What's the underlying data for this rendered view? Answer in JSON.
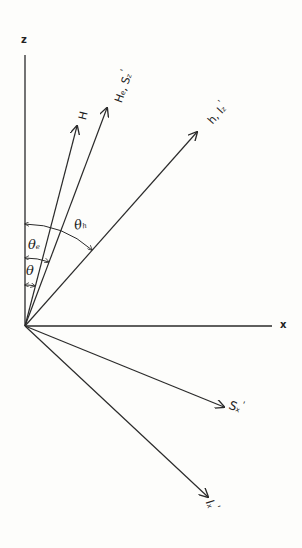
{
  "diagram": {
    "type": "vector-diagram",
    "origin": [
      25,
      326
    ],
    "axes": {
      "z": {
        "label": "z",
        "end": [
          25,
          55
        ]
      },
      "x": {
        "label": "x",
        "end": [
          272,
          326
        ]
      }
    },
    "vectors": [
      {
        "id": "H",
        "label": "H",
        "tip": [
          77,
          126
        ]
      },
      {
        "id": "He",
        "label": "H",
        "label_sub": "e",
        "label2": "S",
        "label2_sub": "z",
        "label2_prime": "'",
        "tip": [
          107,
          108
        ]
      },
      {
        "id": "h",
        "label": "h",
        "label2": "I",
        "label2_sub": "z",
        "label2_prime": "'",
        "tip": [
          197,
          132
        ]
      },
      {
        "id": "Sx",
        "label": "S",
        "label_sub": "x",
        "label_prime": "'",
        "tip": [
          224,
          407
        ]
      },
      {
        "id": "Ix",
        "label": "I",
        "label_sub": "x",
        "label_prime": "'",
        "tip": [
          208,
          497
        ]
      }
    ],
    "angles": [
      {
        "id": "theta",
        "label": "θ",
        "sub": ""
      },
      {
        "id": "theta_e",
        "label": "θ",
        "sub": "e"
      },
      {
        "id": "theta_h",
        "label": "θ",
        "sub": "h"
      }
    ],
    "colors": {
      "line": "#2a2a2a",
      "background": "#fdfdfb"
    }
  }
}
